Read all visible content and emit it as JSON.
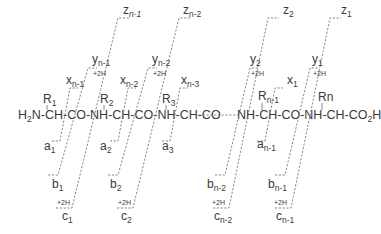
{
  "diagram": {
    "type": "peptide-fragmentation-nomenclature",
    "chain": {
      "left": {
        "segment1": "H",
        "segment1_sub": "2",
        "segment2": "N-CH-CO-NH-CH-CO-NH-CH-CO"
      },
      "right": {
        "segment1": "NH-CH-CO-NH-CH-CO",
        "segment1_sub": "2",
        "segment2": "H"
      }
    },
    "side_chains": [
      {
        "base": "R",
        "sub": "1"
      },
      {
        "base": "R",
        "sub": "2"
      },
      {
        "base": "R",
        "sub": "3"
      },
      {
        "base": "R",
        "sub": "n-1"
      },
      {
        "base": "Rn",
        "sub": ""
      }
    ],
    "n_terminal_ions": {
      "a": [
        {
          "base": "a",
          "sub": "1"
        },
        {
          "base": "a",
          "sub": "2"
        },
        {
          "base": "a",
          "sub": "3"
        },
        {
          "base": "a",
          "sub": "n-1"
        }
      ],
      "b": [
        {
          "base": "b",
          "sub": "1"
        },
        {
          "base": "b",
          "sub": "2"
        },
        {
          "base": "b",
          "sub": "n-2"
        },
        {
          "base": "b",
          "sub": "n-1"
        }
      ],
      "c": [
        {
          "base": "c",
          "sub": "1",
          "mod": "+2H"
        },
        {
          "base": "c",
          "sub": "2",
          "mod": "+2H"
        },
        {
          "base": "c",
          "sub": "n-2",
          "mod": "+2H"
        },
        {
          "base": "c",
          "sub": "n-1",
          "mod": "+2H"
        }
      ]
    },
    "c_terminal_ions": {
      "x": [
        {
          "base": "x",
          "sub": "n-1"
        },
        {
          "base": "x",
          "sub": "n-2"
        },
        {
          "base": "x",
          "sub": "n-3"
        },
        {
          "base": "x",
          "sub": "1"
        }
      ],
      "y": [
        {
          "base": "y",
          "sub": "n-1",
          "mod": "+2H"
        },
        {
          "base": "y",
          "sub": "n-2",
          "mod": "+2H"
        },
        {
          "base": "y",
          "sub": "2",
          "mod": "+2H"
        },
        {
          "base": "y",
          "sub": "1",
          "mod": "+2H"
        }
      ],
      "z": [
        {
          "base": "z",
          "sub": "n-1"
        },
        {
          "base": "z",
          "sub": "n-2"
        },
        {
          "base": "z",
          "sub": "2"
        },
        {
          "base": "z",
          "sub": "1"
        }
      ]
    },
    "colors": {
      "text": "#3a3a3a",
      "lines": "#6a6a6a",
      "background": "#ffffff"
    }
  }
}
